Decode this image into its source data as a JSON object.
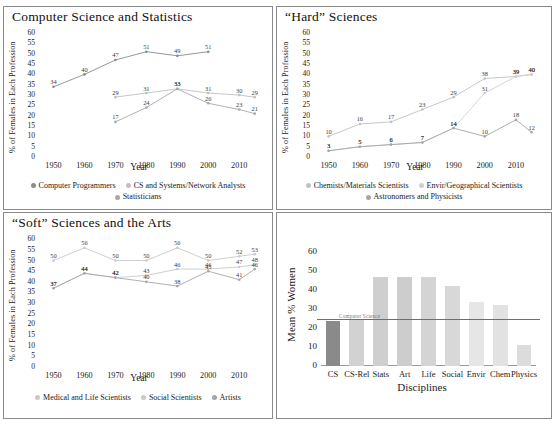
{
  "figure": {
    "top_clipped_text": "",
    "axis_label_y": "% of Females in Each Profession",
    "axis_label_x": "Year"
  },
  "chart_data": [
    {
      "id": "cs-stats",
      "type": "line",
      "title": "Computer Science and Statistics",
      "xlabel": "Year",
      "ylabel": "% of Females in Each Profession",
      "ylim": [
        0,
        62
      ],
      "yticks": [
        0,
        5,
        10,
        15,
        20,
        25,
        30,
        35,
        40,
        45,
        50,
        55,
        60
      ],
      "xticks": [
        "1950",
        "1960",
        "1970",
        "1980",
        "1990",
        "2000",
        "2010"
      ],
      "xlim": [
        1945,
        2018
      ],
      "grid": false,
      "legend_position": "bottom",
      "series": [
        {
          "name": "Computer Programmers",
          "color": "#8b8b8b",
          "x": [
            1950,
            1960,
            1970,
            1980,
            1990,
            2000
          ],
          "values": [
            34,
            40,
            47,
            51,
            49,
            51
          ]
        },
        {
          "name": "CS and Systems/Network Analysts",
          "color": "#c0c0c0",
          "x": [
            1970,
            1980,
            1990,
            2000,
            2010,
            2015
          ],
          "values": [
            29,
            31,
            33,
            31,
            30,
            29
          ]
        },
        {
          "name": "Statisticians",
          "color": "#a8a8a8",
          "x": [
            1970,
            1980,
            1990,
            2000,
            2010,
            2015
          ],
          "values": [
            17,
            24,
            33,
            26,
            23,
            21
          ]
        }
      ]
    },
    {
      "id": "hard-sciences",
      "type": "line",
      "title": "“Hard” Sciences",
      "xlabel": "Year",
      "ylabel": "% of Females in Each Profession",
      "ylim": [
        0,
        62
      ],
      "yticks": [
        0,
        5,
        10,
        15,
        20,
        25,
        30,
        35,
        40,
        45,
        50,
        55,
        60
      ],
      "xticks": [
        "1950",
        "1960",
        "1970",
        "1980",
        "1990",
        "2000",
        "2010"
      ],
      "xlim": [
        1945,
        2018
      ],
      "grid": false,
      "legend_position": "bottom",
      "series": [
        {
          "name": "Chemists/Materials Scientists",
          "color": "#c2c2c2",
          "x": [
            1950,
            1960,
            1970,
            1980,
            1990,
            2000,
            2010,
            2015
          ],
          "values": [
            10,
            16,
            17,
            23,
            29,
            38,
            39,
            40
          ]
        },
        {
          "name": "Envir/Geographical Scientists",
          "color": "#cfcfcf",
          "x": [
            1950,
            1960,
            1970,
            1980,
            1990,
            2000,
            2010,
            2015
          ],
          "values": [
            3,
            5,
            6,
            7,
            14,
            31,
            39,
            40
          ]
        },
        {
          "name": "Astronomers and Physicists",
          "color": "#a6a6a6",
          "x": [
            1950,
            1960,
            1970,
            1980,
            1990,
            2000,
            2010,
            2015
          ],
          "values": [
            3,
            5,
            6,
            7,
            14,
            10,
            18,
            12
          ]
        }
      ]
    },
    {
      "id": "soft-sciences",
      "type": "line",
      "title": "“Soft” Sciences and the Arts",
      "xlabel": "Year",
      "ylabel": "% of Females in Each Profession",
      "ylim": [
        0,
        62
      ],
      "yticks": [
        0,
        5,
        10,
        15,
        20,
        25,
        30,
        35,
        40,
        45,
        50,
        55,
        60
      ],
      "xticks": [
        "1950",
        "1960",
        "1970",
        "1980",
        "1990",
        "2000",
        "2010"
      ],
      "xlim": [
        1945,
        2018
      ],
      "grid": false,
      "legend_position": "bottom",
      "series": [
        {
          "name": "Medical and Life Scientists",
          "color": "#c8c8c8",
          "x": [
            1950,
            1960,
            1970,
            1980,
            1990,
            2000,
            2010,
            2015
          ],
          "values": [
            50,
            56,
            50,
            50,
            56,
            50,
            52,
            53
          ]
        },
        {
          "name": "Social Scientists",
          "color": "#cacaca",
          "x": [
            1950,
            1960,
            1970,
            1980,
            1990,
            2000,
            2010,
            2015
          ],
          "values": [
            37,
            44,
            42,
            43,
            46,
            46,
            47,
            48
          ]
        },
        {
          "name": "Artists",
          "color": "#a6a6a6",
          "x": [
            1950,
            1960,
            1970,
            1980,
            1990,
            2000,
            2010,
            2015
          ],
          "values": [
            37,
            44,
            42,
            40,
            38,
            45,
            41,
            46
          ]
        }
      ]
    },
    {
      "id": "mean-women-by-discipline",
      "type": "bar",
      "title": "",
      "xlabel": "Disciplines",
      "ylabel": "Mean % Women",
      "ylim": [
        0,
        66
      ],
      "yticks": [
        0,
        10,
        20,
        30,
        40,
        50,
        60
      ],
      "categories": [
        "CS",
        "CS-Rel",
        "Stats",
        "Art",
        "Life",
        "Social",
        "Envir",
        "Chem",
        "Physics"
      ],
      "values": [
        24,
        25,
        47,
        47,
        47,
        42,
        34,
        32,
        11
      ],
      "bar_colors": [
        "#8a8a8a",
        "#d2d2d2",
        "#cfcfcf",
        "#cdcdcd",
        "#d4d4d4",
        "#d8d8d8",
        "#e6e6e6",
        "#e2e2e2",
        "#dcdcdc"
      ],
      "reference_line": {
        "value": 25,
        "label": "Computer Science",
        "color": "#6e6e6e"
      },
      "grid": false
    }
  ]
}
